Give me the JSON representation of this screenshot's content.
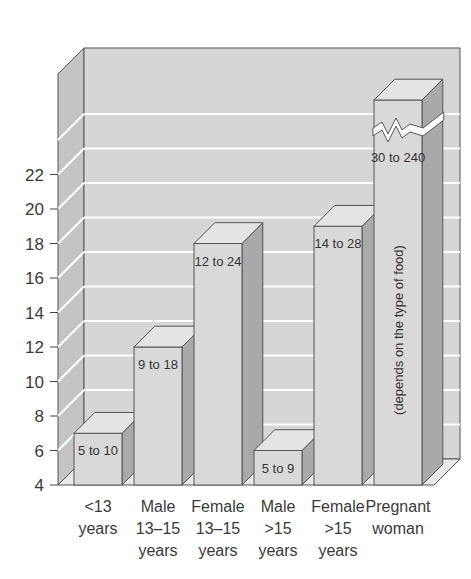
{
  "chart_data": {
    "type": "bar",
    "style": "3d-column",
    "title": "",
    "xlabel": "",
    "ylabel": "",
    "ylim": [
      4,
      22
    ],
    "yticks": [
      4,
      6,
      8,
      10,
      12,
      14,
      16,
      18,
      20,
      22
    ],
    "grid": true,
    "legend": null,
    "categories": [
      [
        "<13",
        "years"
      ],
      [
        "Male",
        "13–15",
        "years"
      ],
      [
        "Female",
        "13–15",
        "years"
      ],
      [
        "Male",
        ">15",
        "years"
      ],
      [
        "Female",
        ">15",
        "years"
      ],
      [
        "Pregnant",
        "woman"
      ]
    ],
    "values": [
      7,
      12,
      18,
      6,
      19,
      30
    ],
    "bar_labels": [
      "5 to 10",
      "9 to 18",
      "12 to 24",
      "5 to 9",
      "14 to 28",
      "30 to 240"
    ],
    "annotations": [
      {
        "bar": 5,
        "text": "(depends on the type of food)",
        "orientation": "vertical"
      },
      {
        "bar": 5,
        "text": "axis break (bar exceeds scale)"
      }
    ]
  },
  "colors": {
    "wall": "#d6d6d6",
    "side_wall": "#c4c4c4",
    "bar_front": "#d9d9d9",
    "bar_top": "#e4e4e4",
    "bar_side": "#a9a9a9",
    "gridline": "#ffffff",
    "outline": "#555555"
  }
}
